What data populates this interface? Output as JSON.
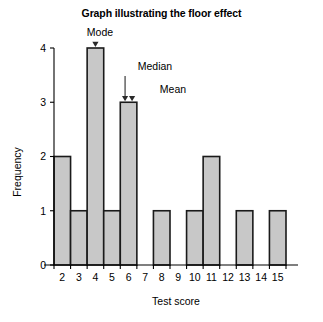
{
  "chart_data": {
    "type": "bar",
    "title": "Graph illustrating the floor effect",
    "xlabel": "Test score",
    "ylabel": "Frequency",
    "categories": [
      "2",
      "3",
      "4",
      "5",
      "6",
      "7",
      "8",
      "9",
      "10",
      "11",
      "12",
      "13",
      "14",
      "15"
    ],
    "values": [
      2,
      1,
      4,
      1,
      3,
      0,
      1,
      0,
      1,
      2,
      0,
      1,
      0,
      1
    ],
    "ylim": [
      0,
      4
    ],
    "yticks": [
      "0",
      "1",
      "2",
      "3",
      "4"
    ],
    "xlim": [
      1.5,
      15.5
    ],
    "grid": false,
    "legend": null,
    "bar_fill_color": "#c8c8c8",
    "bar_edge_color": "#1a1a1a",
    "annotations": [
      {
        "label": "Mode",
        "target_category": "4",
        "target_value": 4
      },
      {
        "label": "Median",
        "target_category": "6",
        "target_value": 3
      },
      {
        "label": "Mean",
        "target_category": "6",
        "target_value": 3
      }
    ]
  }
}
